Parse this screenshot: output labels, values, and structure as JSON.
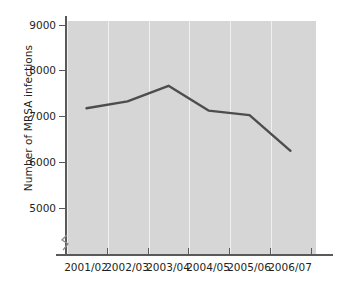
{
  "chart_data": {
    "type": "line",
    "title": "",
    "subtitle": "",
    "xlabel": "",
    "ylabel": "Number of MRSA infections",
    "categories": [
      "2001/02",
      "2002/03",
      "2003/04",
      "2004/05",
      "2005/06",
      "2006/07"
    ],
    "values": [
      7180,
      7330,
      7670,
      7130,
      7030,
      6250
    ],
    "series": [
      {
        "name": "Number of MRSA infections",
        "values": [
          7180,
          7330,
          7670,
          7130,
          7030,
          6250
        ]
      }
    ],
    "ylim": [
      4700,
      9000
    ],
    "yticks": [
      5000,
      6000,
      7000,
      8000,
      9000
    ],
    "ytick_labels": [
      "5000",
      "6000",
      "7000",
      "8000",
      "9000"
    ],
    "xtick_labels": [
      "2001/02",
      "2002/03",
      "2003/04",
      "2004/05",
      "2005/06",
      "2006/07"
    ],
    "grid": "vertical",
    "legend": "none",
    "axis_break": "y-axis broken below 5000",
    "annotations": [],
    "colors": {
      "line": "#4d4d4d",
      "plot_background": "#d6d6d6",
      "gridline": "#f0f0f0",
      "axis": "#58595b",
      "text": "#231f20",
      "page_background": "#ffffff"
    }
  }
}
